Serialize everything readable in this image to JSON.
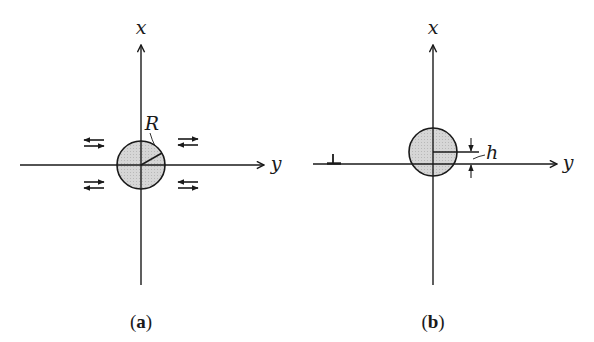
{
  "figure": {
    "panels": [
      {
        "id": "a",
        "caption_open": "(",
        "caption_letter": "a",
        "caption_close": ")",
        "x_axis_label": "x",
        "y_axis_label": "y",
        "radius_label": "R",
        "description": "Circular inclusion of radius R at the origin under shear loading (paired opposing arrows in each quadrant)"
      },
      {
        "id": "b",
        "caption_open": "(",
        "caption_letter": "b",
        "caption_close": ")",
        "x_axis_label": "x",
        "y_axis_label": "y",
        "offset_label": "h",
        "dislocation_symbol": "⊥",
        "description": "Circular inclusion offset by distance h from the y axis, with an edge dislocation on the y axis"
      }
    ],
    "colors": {
      "line": "#1a1a1a",
      "circle_fill": "#d4d4d4",
      "background": "#ffffff"
    }
  }
}
